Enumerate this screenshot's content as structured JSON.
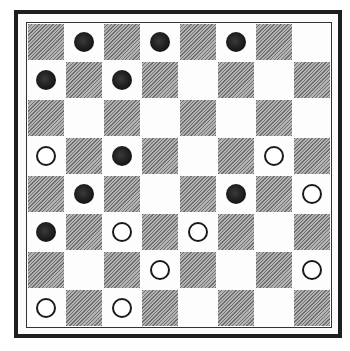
{
  "board": {
    "size": 8,
    "light_color": "#fdfdfd",
    "dark_color": "#9a9a9a",
    "dark_square_parity": "even",
    "rows": [
      [
        "",
        "B",
        "",
        "B",
        "",
        "B",
        "",
        ""
      ],
      [
        "B",
        "",
        "B",
        "",
        "",
        "",
        "",
        ""
      ],
      [
        "",
        "",
        "",
        "",
        "",
        "",
        "",
        ""
      ],
      [
        "W",
        "",
        "B",
        "",
        "",
        "",
        "W",
        ""
      ],
      [
        "",
        "B",
        "",
        "",
        "",
        "B",
        "",
        "W"
      ],
      [
        "B",
        "",
        "W",
        "",
        "W",
        "",
        "",
        ""
      ],
      [
        "",
        "",
        "",
        "W",
        "",
        "",
        "",
        "W"
      ],
      [
        "W",
        "",
        "W",
        "",
        "",
        "",
        "",
        ""
      ]
    ]
  },
  "pieces": {
    "black_color": "#141414",
    "white_fill": "#ffffff",
    "white_outline": "#1a1a1a",
    "black_count": 9,
    "white_count": 9
  }
}
